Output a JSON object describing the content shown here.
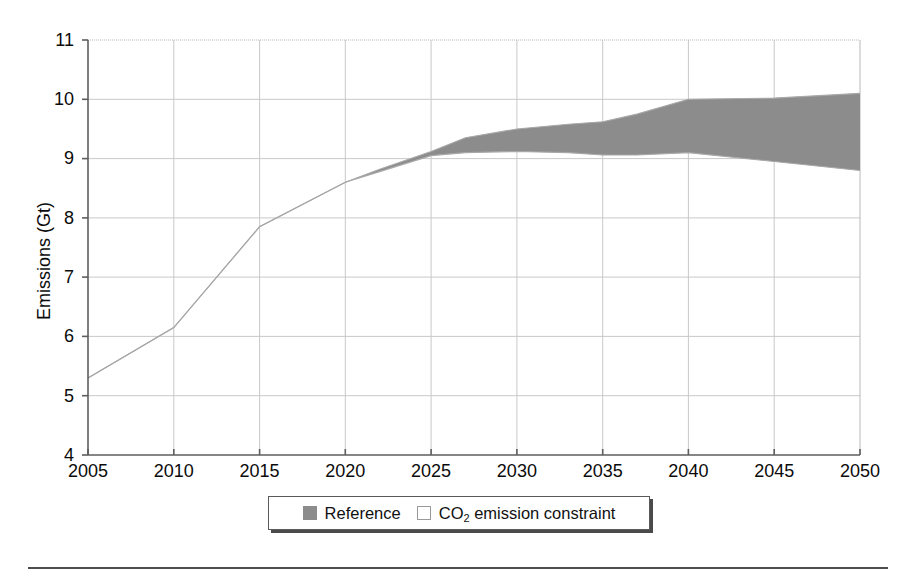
{
  "figure": {
    "background_color": "#ffffff",
    "band_color": "#8c8c8c",
    "line_color": "#a8a8a8",
    "axis_color": "#6b6b6b",
    "grid_color": "#c8c8c8"
  },
  "legend": {
    "position": "bottom-center",
    "entries": [
      {
        "label": "Reference",
        "marker": "filled-square",
        "color": "#8c8c8c"
      },
      {
        "label_prefix": "CO",
        "label_sub": "2",
        "label_suffix": " emission constraint",
        "marker": "hollow-square",
        "color": "#ffffff"
      }
    ]
  },
  "axes": {
    "ylabel": "Emissions (Gt)",
    "xlabel": "",
    "yticks": [
      "11",
      "10",
      "9",
      "8",
      "7",
      "6",
      "5",
      "4"
    ],
    "xticks": [
      "2005",
      "2010",
      "2015",
      "2020",
      "2025",
      "2030",
      "2035",
      "2040",
      "2045",
      "2050"
    ]
  },
  "chart_data": {
    "type": "area",
    "title": "",
    "subtitle": "",
    "xlabel": "",
    "ylabel": "Emissions (Gt)",
    "xlim": [
      2005,
      2050
    ],
    "ylim": [
      4,
      11
    ],
    "xticks": [
      2005,
      2010,
      2015,
      2020,
      2025,
      2030,
      2035,
      2040,
      2045,
      2050
    ],
    "yticks": [
      4,
      5,
      6,
      7,
      8,
      9,
      10,
      11
    ],
    "grid": true,
    "legend_position": "bottom-center",
    "x": [
      2005,
      2010,
      2015,
      2020,
      2022,
      2025,
      2027,
      2030,
      2033,
      2035,
      2037,
      2040,
      2045,
      2050
    ],
    "series": [
      {
        "name": "Reference",
        "role": "band-upper",
        "values": [
          5.3,
          6.15,
          7.85,
          8.6,
          8.82,
          9.12,
          9.35,
          9.5,
          9.58,
          9.62,
          9.75,
          10.0,
          10.02,
          10.1
        ]
      },
      {
        "name": "CO2 emission constraint",
        "role": "band-lower",
        "values": [
          5.3,
          6.15,
          7.85,
          8.6,
          8.78,
          9.05,
          9.1,
          9.12,
          9.1,
          9.06,
          9.06,
          9.1,
          8.95,
          8.8
        ]
      }
    ],
    "annotations": [
      {
        "text": "Band (shaded) spans Reference upper bound and CO2 emission constraint lower bound; curves coincide before 2020."
      }
    ]
  }
}
